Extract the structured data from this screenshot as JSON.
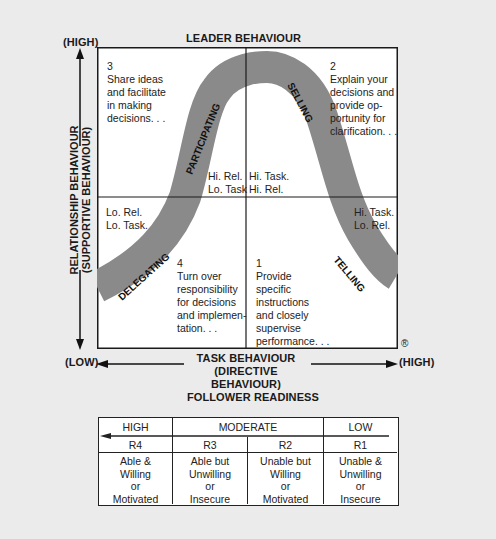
{
  "diagram": {
    "title": "LEADER BEHAVIOUR",
    "y_axis": {
      "high_label": "(HIGH)",
      "label_line1": "RELATIONSHIP BEHAVIOUR",
      "label_line2": "(SUPPORTIVE BEHAVIOUR)"
    },
    "x_axis": {
      "low_label": "(LOW)",
      "high_label": "(HIGH)",
      "label_line1": "TASK BEHAVIOUR",
      "label_line2": "(DIRECTIVE BEHAVIOUR)"
    },
    "registered_mark": "®",
    "quadrants": {
      "q3": {
        "number": "3",
        "lines": [
          "Share ideas",
          "and facilitate",
          "in making",
          "decisions. . ."
        ],
        "style": "PARTICIPATING",
        "corner_lines": [
          "Hi. Rel.",
          "Lo. Task"
        ]
      },
      "q2": {
        "number": "2",
        "lines": [
          "Explain your",
          "decisions and",
          "provide op-",
          "portunity for",
          "clarification. . ."
        ],
        "style": "SELLING",
        "corner_lines": [
          "Hi. Task.",
          "Hi. Rel."
        ]
      },
      "q4": {
        "number": "4",
        "lines": [
          "Turn over",
          "responsibility",
          "for decisions",
          "and implemen-",
          "tation. . ."
        ],
        "style": "DELEGATING",
        "corner_lines": [
          "Lo. Rel.",
          "Lo. Task."
        ]
      },
      "q1": {
        "number": "1",
        "lines": [
          "Provide",
          "specific",
          "instructions",
          "and closely",
          "supervise",
          "performance. . ."
        ],
        "style": "TELLING",
        "corner_lines": [
          "Hi. Task.",
          "Lo. Rel."
        ]
      }
    }
  },
  "readiness": {
    "title": "FOLLOWER READINESS",
    "levels": [
      "HIGH",
      "MODERATE",
      "LOW"
    ],
    "codes": [
      "R4",
      "R3",
      "R2",
      "R1"
    ],
    "descriptions": [
      [
        "Able &",
        "Willing",
        "or",
        "Motivated"
      ],
      [
        "Able but",
        "Unwilling",
        "or",
        "Insecure"
      ],
      [
        "Unable but",
        "Willing",
        "or",
        "Motivated"
      ],
      [
        "Unable &",
        "Unwilling",
        "or",
        "Insecure"
      ]
    ]
  },
  "colors": {
    "curve": "#8a8a8a",
    "background": "#ebebeb",
    "box": "#ffffff",
    "line": "#1a1a1a"
  }
}
